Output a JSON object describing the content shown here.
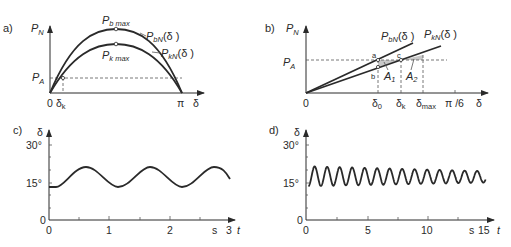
{
  "panels": {
    "a": {
      "label": "a)",
      "y_axis": {
        "symbol": "P",
        "sub": "N"
      },
      "x_axis": {
        "symbol": "δ"
      },
      "ticks_x": {
        "zero": "0",
        "delta_k": "δ",
        "delta_k_sub": "k",
        "pi": "π"
      },
      "ticks_y": {
        "pa": "P",
        "pa_sub": "A"
      },
      "peak_b": {
        "symbol": "P",
        "sub": "b max"
      },
      "peak_k": {
        "symbol": "P",
        "sub": "k max"
      },
      "curve_b": {
        "symbol": "P",
        "sub": "bN",
        "arg": "(δ )"
      },
      "curve_k": {
        "symbol": "P",
        "sub": "kN",
        "arg": "(δ )"
      }
    },
    "b": {
      "label": "b)",
      "y_axis": {
        "symbol": "P",
        "sub": "N"
      },
      "x_axis": {
        "symbol": "δ"
      },
      "ticks_x": {
        "zero": "0",
        "d0": "δ",
        "d0_sub": "0",
        "dk": "δ",
        "dk_sub": "k",
        "dmax": "δ",
        "dmax_sub": "max",
        "pi6": "π /6"
      },
      "ticks_y": {
        "pa": "P",
        "pa_sub": "A"
      },
      "points": {
        "a": "a",
        "b": "b",
        "c": "c"
      },
      "areas": {
        "a1": "A",
        "a1_sub": "1",
        "a2": "A",
        "a2_sub": "2"
      },
      "curve_b": {
        "symbol": "P",
        "sub": "bN",
        "arg": "(δ )"
      },
      "curve_k": {
        "symbol": "P",
        "sub": "kN",
        "arg": "(δ )"
      }
    },
    "c": {
      "label": "c)",
      "y_axis": {
        "symbol": "δ"
      },
      "x_axis": {
        "symbol": "t",
        "unit": "s"
      },
      "ticks_y": [
        "0",
        "15°",
        "30°"
      ],
      "ticks_x": [
        "0",
        "1",
        "2",
        "3"
      ]
    },
    "d": {
      "label": "d)",
      "y_axis": {
        "symbol": "δ"
      },
      "x_axis": {
        "symbol": "t",
        "unit": "s"
      },
      "ticks_y": [
        "0",
        "15°",
        "30°"
      ],
      "ticks_x": [
        "0",
        "5",
        "10",
        "15"
      ]
    }
  },
  "chart_data": [
    {
      "type": "line",
      "title": "a) Power-angle characteristics",
      "xlabel": "δ",
      "ylabel": "P_N",
      "xlim": [
        0,
        3.1416
      ],
      "series": [
        {
          "name": "P_bN(δ)",
          "shape": "sin",
          "peak_label": "P_b max"
        },
        {
          "name": "P_kN(δ)",
          "shape": "sin",
          "peak_label": "P_k max",
          "relative_amplitude": 0.78
        }
      ],
      "annotations": [
        "P_A (horizontal dashed line)",
        "δ_k (intersection of P_kN with P_A)",
        "0",
        "π"
      ]
    },
    {
      "type": "line",
      "title": "b) Equal-area criterion (linearized)",
      "xlabel": "δ",
      "ylabel": "P_N",
      "x_ticks": [
        "0",
        "δ_0",
        "δ_k",
        "δ_max",
        "π/6"
      ],
      "series": [
        {
          "name": "P_bN(δ)"
        },
        {
          "name": "P_kN(δ)"
        }
      ],
      "annotations": [
        "a",
        "b",
        "c",
        "A_1",
        "A_2",
        "P_A"
      ]
    },
    {
      "type": "line",
      "title": "c) Rotor angle oscillation",
      "xlabel": "t (s)",
      "ylabel": "δ",
      "xlim": [
        0,
        3
      ],
      "ylim": [
        0,
        30
      ],
      "x_ticks": [
        0,
        1,
        2,
        3
      ],
      "y_ticks": [
        "0",
        "15°",
        "30°"
      ],
      "series": [
        {
          "name": "δ(t)",
          "start": 13.5,
          "min": 13.5,
          "max": 21.5,
          "period_s": 1.03
        }
      ]
    },
    {
      "type": "line",
      "title": "d) Rotor angle oscillation (damped)",
      "xlabel": "t (s)",
      "ylabel": "δ",
      "xlim": [
        0,
        15
      ],
      "ylim": [
        0,
        30
      ],
      "x_ticks": [
        0,
        5,
        10,
        15
      ],
      "y_ticks": [
        "0",
        "15°",
        "30°"
      ],
      "series": [
        {
          "name": "δ(t)",
          "start": 13.5,
          "initial_min": 13.5,
          "initial_max": 21.5,
          "final_min": 15,
          "final_max": 19.5,
          "period_s": 1.03
        }
      ]
    }
  ]
}
